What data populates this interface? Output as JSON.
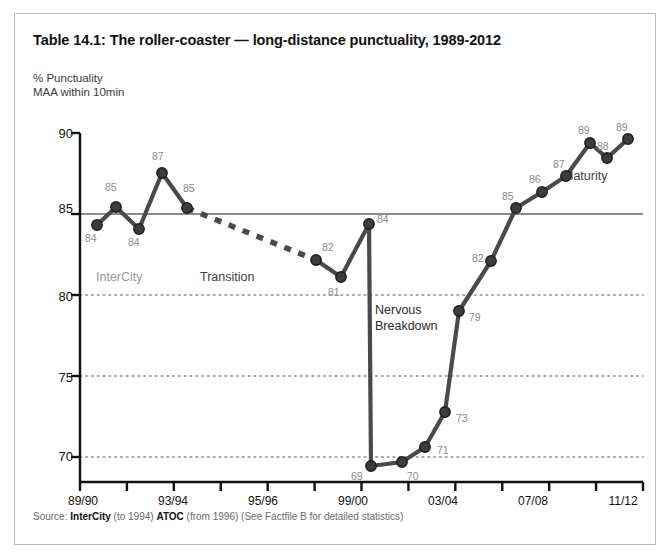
{
  "title": "Table 14.1: The roller-coaster — long-distance punctuality, 1989-2012",
  "axis_title": "% Punctuality\nMAA within 10min",
  "source": {
    "prefix": "Source: ",
    "bold1": "InterCity",
    "mid1": " (to 1994) ",
    "bold2": "ATOC",
    "mid2": " (from 1996)  (See Factfile B for detailed statistics)"
  },
  "annotations": {
    "intercity": "InterCity",
    "transition": "Transition",
    "nervous_line1": "Nervous",
    "nervous_line2": "Breakdown",
    "maturity": "Maturity"
  },
  "colors": {
    "line": "#4a4a4a",
    "marker": "#3c3c3c",
    "reference_line": "#8c8c8c",
    "grid": "#8c8c8c",
    "axis": "#111111",
    "label": "#8a8a8a",
    "border": "#b9b9b9"
  },
  "chart_data": {
    "type": "line",
    "title": "Table 14.1: The roller-coaster — long-distance punctuality, 1989-2012",
    "xlabel": "",
    "ylabel": "% Punctuality MAA within 10min",
    "ylim": [
      68.5,
      90
    ],
    "xlim": [
      0,
      23
    ],
    "grid": true,
    "gridlines": [
      80,
      75,
      70
    ],
    "reference_line": 85,
    "legend": "none",
    "y_ticks": [
      90,
      85,
      80,
      75,
      70
    ],
    "x_tick_labels": [
      "89/90",
      "",
      "93/94",
      "",
      "95/96",
      "",
      "99/00",
      "",
      "03/04",
      "",
      "07/08",
      "",
      "11/12"
    ],
    "x_ticks_all": [
      "89/90",
      "91/92",
      "93/94",
      "95/96",
      "97/98",
      "99/00",
      "01/02",
      "03/04",
      "05/06",
      "07/08",
      "09/10",
      "11/12"
    ],
    "series": [
      {
        "name": "InterCity",
        "style": "solid",
        "x": [
          0,
          1,
          2,
          3,
          4
        ],
        "x_labels": [
          "89/90",
          "90/91",
          "91/92",
          "92/93",
          "93/94"
        ],
        "values": [
          84,
          85,
          84,
          87,
          85
        ]
      },
      {
        "name": "Transition",
        "style": "dashed",
        "x": [
          4,
          9
        ],
        "x_labels": [
          "93/94",
          "96/97"
        ],
        "values": [
          85,
          82
        ]
      },
      {
        "name": "ATOC",
        "style": "solid",
        "x": [
          9,
          10,
          11,
          12,
          13,
          14,
          15,
          16,
          17,
          18,
          19,
          20,
          21,
          22,
          23
        ],
        "x_labels": [
          "96/97",
          "97/98",
          "99/00",
          "00/01",
          "01/02",
          "02/03",
          "03/04",
          "04/05",
          "05/06",
          "06/07",
          "07/08",
          "08/09",
          "09/10",
          "10/11",
          "11/12"
        ],
        "values": [
          82,
          81,
          84,
          69,
          70,
          71,
          73,
          79,
          82,
          85,
          86,
          87,
          89,
          88,
          89
        ]
      }
    ],
    "points": [
      {
        "label": "84",
        "value": 84,
        "px": 82,
        "py": 211,
        "lx": 70,
        "ly": 218
      },
      {
        "label": "85",
        "value": 85,
        "px": 101,
        "py": 193,
        "lx": 90,
        "ly": 167
      },
      {
        "label": "84",
        "value": 84,
        "px": 124,
        "py": 215,
        "lx": 113,
        "ly": 222
      },
      {
        "label": "87",
        "value": 87,
        "px": 147,
        "py": 159,
        "lx": 137,
        "ly": 136
      },
      {
        "label": "85",
        "value": 85,
        "px": 172,
        "py": 194,
        "lx": 168,
        "ly": 168
      },
      {
        "label": "82",
        "value": 82,
        "px": 301,
        "py": 246,
        "lx": 307,
        "ly": 227
      },
      {
        "label": "81",
        "value": 81,
        "px": 326,
        "py": 263,
        "lx": 313,
        "ly": 272
      },
      {
        "label": "84",
        "value": 84,
        "px": 354,
        "py": 210,
        "lx": 362,
        "ly": 199
      },
      {
        "label": "69",
        "value": 69,
        "px": 356,
        "py": 452,
        "lx": 336,
        "ly": 456
      },
      {
        "label": "70",
        "value": 70,
        "px": 387,
        "py": 448,
        "lx": 392,
        "ly": 456
      },
      {
        "label": "71",
        "value": 71,
        "px": 410,
        "py": 433,
        "lx": 422,
        "ly": 430
      },
      {
        "label": "73",
        "value": 73,
        "px": 430,
        "py": 398,
        "lx": 441,
        "ly": 398
      },
      {
        "label": "79",
        "value": 79,
        "px": 444,
        "py": 297,
        "lx": 454,
        "ly": 297
      },
      {
        "label": "82",
        "value": 82,
        "px": 476,
        "py": 247,
        "lx": 457,
        "ly": 238
      },
      {
        "label": "85",
        "value": 85,
        "px": 501,
        "py": 194,
        "lx": 487,
        "ly": 176
      },
      {
        "label": "86",
        "value": 86,
        "px": 527,
        "py": 178,
        "lx": 514,
        "ly": 159
      },
      {
        "label": "87",
        "value": 87,
        "px": 551,
        "py": 162,
        "lx": 538,
        "ly": 144
      },
      {
        "label": "89",
        "value": 89,
        "px": 575,
        "py": 129,
        "lx": 563,
        "ly": 110
      },
      {
        "label": "88",
        "value": 88,
        "px": 592,
        "py": 144,
        "lx": 582,
        "ly": 126
      },
      {
        "label": "89",
        "value": 89,
        "px": 613,
        "py": 125,
        "lx": 601,
        "ly": 107
      }
    ]
  }
}
